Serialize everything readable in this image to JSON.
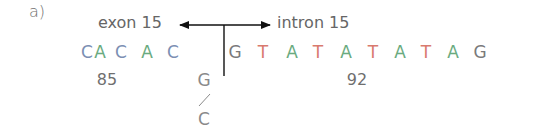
{
  "figure": {
    "panel_label": "a)",
    "exon_label": "exon 15",
    "intron_label": "intron 15",
    "sequence": [
      {
        "base": "C",
        "region": "exon",
        "x": 87
      },
      {
        "base": "A",
        "region": "exon",
        "x": 100
      },
      {
        "base": "C",
        "region": "exon",
        "x": 121
      },
      {
        "base": "A",
        "region": "exon",
        "x": 147
      },
      {
        "base": "C",
        "region": "exon",
        "x": 173
      },
      {
        "base": "G",
        "region": "intron",
        "x": 235
      },
      {
        "base": "T",
        "region": "intron",
        "x": 263
      },
      {
        "base": "A",
        "region": "intron",
        "x": 292
      },
      {
        "base": "T",
        "region": "intron",
        "x": 318
      },
      {
        "base": "A",
        "region": "intron",
        "x": 346
      },
      {
        "base": "T",
        "region": "intron",
        "x": 373
      },
      {
        "base": "A",
        "region": "intron",
        "x": 400
      },
      {
        "base": "T",
        "region": "intron",
        "x": 426
      },
      {
        "base": "A",
        "region": "intron",
        "x": 453
      },
      {
        "base": "G",
        "region": "intron",
        "x": 480
      }
    ],
    "position_labels": [
      {
        "text": "85",
        "x": 107
      },
      {
        "text": "92",
        "x": 357
      }
    ],
    "variant": {
      "reference": "G",
      "separator": "/",
      "alternate": "C"
    },
    "colors": {
      "C": "#7b8fb3",
      "A": "#6aab80",
      "T": "#d97a6e",
      "G": "#7a7a7a",
      "line": "#111111"
    }
  }
}
